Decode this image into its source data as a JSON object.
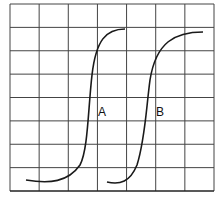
{
  "diagram": {
    "grid": {
      "left": 10,
      "top": 4,
      "right": 214,
      "bottom": 191,
      "columns": 7,
      "rows": 8,
      "line_color": "#444444",
      "axis_color": "#222222"
    },
    "curves": [
      {
        "label": "A",
        "color": "#1a1a1a",
        "path": "M 26 180 C 50 184, 68 182, 80 165 C 88 150, 88 110, 92 75 C 96 40, 106 29, 125 29",
        "label_pos": {
          "x": 98,
          "y": 105
        }
      },
      {
        "label": "B",
        "color": "#1a1a1a",
        "path": "M 107 182 C 120 185, 130 182, 137 165 C 145 140, 146 110, 150 80 C 156 42, 175 32, 203 32",
        "label_pos": {
          "x": 156,
          "y": 105
        }
      }
    ]
  }
}
